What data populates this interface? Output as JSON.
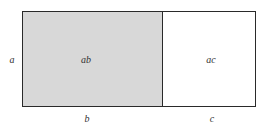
{
  "diagram": {
    "type": "area-model-rectangle",
    "side_label_left": "a",
    "regions": [
      {
        "id": "ab",
        "label": "ab",
        "fill": "#d8d8d8",
        "bottom_label": "b"
      },
      {
        "id": "ac",
        "label": "ac",
        "fill": "#ffffff",
        "bottom_label": "c"
      }
    ],
    "border_color": "#2a2a2a",
    "text_color": "#333333"
  }
}
